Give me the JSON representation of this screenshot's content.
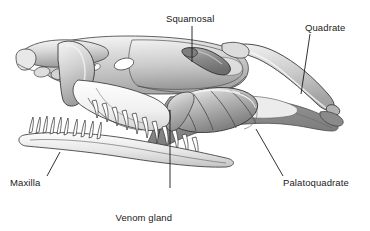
{
  "figure": {
    "background_color": "#ffffff",
    "line_color": "#1a1a1a",
    "labels": [
      {
        "id": "squamosal",
        "text": "Squamosal",
        "x": 166,
        "y": 13
      },
      {
        "id": "quadrate",
        "text": "Quadrate",
        "x": 305,
        "y": 22
      },
      {
        "id": "maxilla",
        "text": "Maxilla",
        "x": 10,
        "y": 177
      },
      {
        "id": "venom-gland",
        "text": "Venom gland",
        "x": 114,
        "y": 190
      },
      {
        "id": "venom-duct",
        "text": "with long duct",
        "x": 114,
        "y": 201
      },
      {
        "id": "palatoquadrate",
        "text": "Palatoquadrate",
        "x": 283,
        "y": 177
      }
    ],
    "structures": [
      {
        "id": "cranium",
        "name": "Cranium / skull roof",
        "fill": "#cfcfcf"
      },
      {
        "id": "squamosal-bone",
        "name": "Squamosal bone",
        "fill": "#8e8e8e"
      },
      {
        "id": "quadrate-bone",
        "name": "Quadrate bone",
        "fill": "#d2d2d2"
      },
      {
        "id": "palatoquadrate-arc",
        "name": "Palatoquadrate arcade",
        "fill": "#8c8c8c"
      },
      {
        "id": "venom-gland-body",
        "name": "Lobed venom gland",
        "fill": "#b4b4b4"
      },
      {
        "id": "maxilla-bone",
        "name": "Maxilla with tooth row",
        "fill": "#e9e9e9"
      },
      {
        "id": "mandible-bone",
        "name": "Mandible / lower jaw",
        "fill": "#e2e2e2"
      }
    ],
    "colors": {
      "light_bone": "#ededed",
      "mid_bone": "#c7c7c7",
      "dark_bone": "#8c8c8c",
      "outline": "#2b2b2b",
      "fenestra": "#ffffff"
    }
  }
}
